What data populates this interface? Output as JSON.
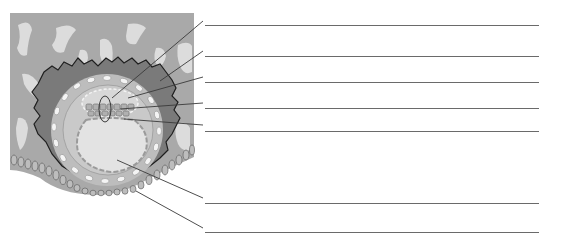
{
  "diagram": {
    "type": "labeled-histology-diagram",
    "colors": {
      "tissue_background": "#a9a9a9",
      "tissue_blobs": "#dcdcdc",
      "dark_layer": "#7a7a7a",
      "outline": "#1e1e1e",
      "outer_ring": "#bdbdbd",
      "cell_white": "#f4f4f4",
      "inner_ring": "#c9c9c9",
      "cavity": "#e3e3e3",
      "leader_line": "#3a3a3a",
      "answer_line": "#6a6a6a"
    },
    "labels": [
      {
        "id": 1,
        "text": "",
        "line_y": 25,
        "target": [
          112,
          98
        ]
      },
      {
        "id": 2,
        "text": "",
        "line_y": 56,
        "target": [
          160,
          81
        ]
      },
      {
        "id": 3,
        "text": "",
        "line_y": 82,
        "target": [
          128,
          98
        ]
      },
      {
        "id": 4,
        "text": "",
        "line_y": 108,
        "target": [
          120,
          109
        ]
      },
      {
        "id": 5,
        "text": "",
        "line_y": 131,
        "target": [
          124,
          119
        ]
      },
      {
        "id": 6,
        "text": "",
        "line_y": 203,
        "target": [
          117,
          160
        ]
      },
      {
        "id": 7,
        "text": "",
        "line_y": 232,
        "target": [
          136,
          191
        ]
      }
    ],
    "answer_line_x_start": 205,
    "answer_line_x_end": 539
  }
}
